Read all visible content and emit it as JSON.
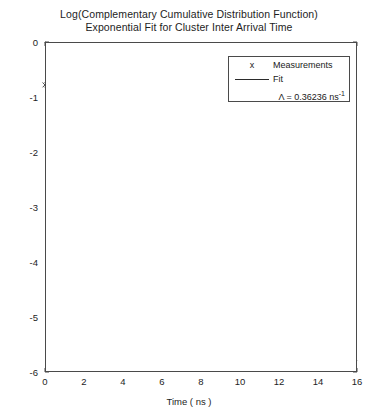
{
  "chart_data": {
    "type": "line",
    "title": "Log(Complementary Cumulative Distribution Function) Exponential Fit for Cluster Inter Arrival Time",
    "title_lines": [
      "Log(Complementary Cumulative Distribution Function)",
      "Exponential Fit for Cluster Inter Arrival Time"
    ],
    "xlabel": "Time ( ns )",
    "ylabel": "Log (Magnitude dB)",
    "xlim": [
      0,
      16
    ],
    "ylim": [
      -6,
      0
    ],
    "xticks": [
      0,
      2,
      4,
      6,
      8,
      10,
      12,
      14,
      16
    ],
    "xtick_labels": [
      "0",
      "2",
      "4",
      "6",
      "8",
      "10",
      "12",
      "14",
      "16"
    ],
    "yticks": [
      0,
      -1,
      -2,
      -3,
      -4,
      -5,
      -6
    ],
    "ytick_labels": [
      "0",
      "-1",
      "-2",
      "-3",
      "-4",
      "-5",
      "-6"
    ],
    "grid": true,
    "grid_style": "dotted",
    "legend_position": "upper right",
    "legend": {
      "measurements_label": "Measurements",
      "measurements_marker": "x",
      "fit_label": "Fit",
      "annotation_prefix": "Λ = 0.36236 ns",
      "annotation_exponent": "-1",
      "annotation_full": "Λ = 0.36236 ns⁻¹"
    },
    "series": [
      {
        "name": "Fit",
        "type": "line",
        "color": "#2b2b2b",
        "slope": -0.36236,
        "intercept": 0,
        "x": [
          0,
          16
        ],
        "values": [
          0,
          -5.798
        ]
      },
      {
        "name": "Measurements",
        "type": "scatter",
        "marker": "x",
        "color": "#3d3d3d",
        "x": [
          0.0,
          0.1,
          0.2,
          0.3,
          0.4,
          0.52,
          0.64,
          0.76,
          0.88,
          1.0,
          1.12,
          1.24,
          1.36,
          1.48,
          1.6,
          1.72,
          1.84,
          1.96,
          2.08,
          2.2,
          2.32,
          2.44,
          2.56,
          2.68,
          2.8,
          2.92,
          3.04,
          3.16,
          3.28,
          3.4,
          3.52,
          3.64,
          3.76,
          3.88,
          4.0,
          4.12,
          4.24,
          4.36,
          4.48,
          4.6,
          4.72,
          4.84,
          4.96,
          5.08,
          5.2,
          5.32,
          5.44,
          5.56,
          5.68,
          5.8,
          5.92,
          6.04,
          6.16,
          6.28,
          6.4,
          6.52,
          6.64,
          6.76,
          6.88,
          7.0,
          7.1,
          7.2,
          7.4,
          7.6,
          7.8,
          8.0,
          8.2,
          8.4,
          8.6,
          8.8,
          9.0,
          9.3,
          9.5,
          9.7,
          9.9,
          10.1,
          10.3,
          10.5,
          10.7,
          10.9,
          11.1,
          11.4,
          11.8,
          12.0,
          12.2,
          12.4,
          12.6,
          12.8,
          13.0,
          13.2,
          13.4,
          13.8,
          14.3,
          14.5,
          14.7,
          14.9,
          15.1,
          15.3,
          15.5,
          15.7
        ],
        "values": [
          -0.78,
          -0.78,
          -0.79,
          -0.79,
          -0.8,
          -0.81,
          -0.83,
          -0.85,
          -0.88,
          -0.91,
          -0.95,
          -0.99,
          -1.03,
          -1.08,
          -1.13,
          -1.18,
          -1.23,
          -1.28,
          -1.33,
          -1.38,
          -1.43,
          -1.47,
          -1.51,
          -1.54,
          -1.56,
          -1.58,
          -1.59,
          -1.6,
          -1.61,
          -1.63,
          -1.66,
          -1.7,
          -1.74,
          -1.77,
          -1.79,
          -1.8,
          -1.8,
          -1.81,
          -1.82,
          -1.83,
          -1.85,
          -1.88,
          -1.92,
          -1.95,
          -1.98,
          -2.0,
          -2.02,
          -2.04,
          -2.06,
          -2.08,
          -2.1,
          -2.12,
          -2.14,
          -2.16,
          -2.18,
          -2.2,
          -2.22,
          -2.24,
          -2.26,
          -2.28,
          -2.3,
          -2.3,
          -2.3,
          -2.3,
          -2.3,
          -2.3,
          -2.55,
          -2.62,
          -2.7,
          -2.78,
          -2.95,
          -3.35,
          -3.35,
          -3.35,
          -3.35,
          -4.0,
          -4.0,
          -4.0,
          -4.0,
          -4.0,
          -4.0,
          -4.2,
          -4.45,
          -4.45,
          -4.45,
          -4.45,
          -4.45,
          -4.45,
          -4.45,
          -4.45,
          -4.45,
          -4.85,
          -5.6,
          -5.6,
          -5.6,
          -5.6,
          -5.6,
          -5.6,
          -5.6,
          -5.6
        ]
      }
    ]
  }
}
